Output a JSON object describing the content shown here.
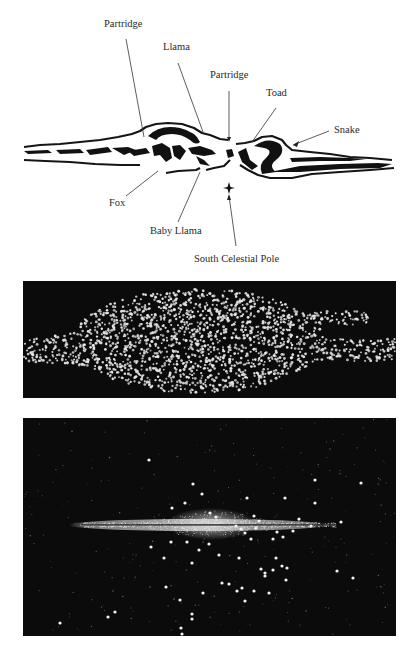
{
  "diagram": {
    "title_panel_1": "Inca dark-cloud constellations drawing",
    "labels": [
      {
        "id": "partridge-left",
        "text": "Partridge",
        "x": 104,
        "y": 25
      },
      {
        "id": "llama",
        "text": "Llama",
        "x": 163,
        "y": 48
      },
      {
        "id": "partridge-center",
        "text": "Partridge",
        "x": 210,
        "y": 76
      },
      {
        "id": "toad",
        "text": "Toad",
        "x": 265,
        "y": 94
      },
      {
        "id": "snake",
        "text": "Snake",
        "x": 333,
        "y": 123
      },
      {
        "id": "fox",
        "text": "Fox",
        "x": 109,
        "y": 196
      },
      {
        "id": "baby-llama",
        "text": "Baby Llama",
        "x": 150,
        "y": 224
      },
      {
        "id": "south-celestial-pole",
        "text": "South Celestial Pole",
        "x": 194,
        "y": 251
      }
    ],
    "leader_lines": [
      {
        "for": "partridge-left",
        "x1": 126,
        "y1": 39,
        "x2": 144,
        "y2": 137
      },
      {
        "for": "llama",
        "x1": 178,
        "y1": 63,
        "x2": 203,
        "y2": 132
      },
      {
        "for": "partridge-center",
        "x1": 229,
        "y1": 91,
        "x2": 229,
        "y2": 140
      },
      {
        "for": "toad",
        "x1": 276,
        "y1": 108,
        "x2": 252,
        "y2": 142
      },
      {
        "for": "snake",
        "x1": 329,
        "y1": 131,
        "x2": 293,
        "y2": 145
      },
      {
        "for": "fox",
        "x1": 126,
        "y1": 196,
        "x2": 158,
        "y2": 171
      },
      {
        "for": "baby-llama",
        "x1": 178,
        "y1": 222,
        "x2": 200,
        "y2": 172
      },
      {
        "for": "south-celestial-pole",
        "x1": 236,
        "y1": 246,
        "x2": 229,
        "y2": 196
      }
    ],
    "pole_marker": {
      "x": 229,
      "y": 188
    }
  },
  "panel_2": {
    "name": "Milky Way star-field drawing",
    "background": "#0b0b0b",
    "dot_color": "#e8e8e8"
  },
  "panel_3": {
    "name": "Milky Way edge-on photograph",
    "background": "#050505",
    "bright_stars": [
      [
        126,
        42
      ],
      [
        170,
        66
      ],
      [
        179,
        76
      ],
      [
        292,
        62
      ],
      [
        338,
        65
      ],
      [
        377,
        92
      ],
      [
        149,
        90
      ],
      [
        162,
        85
      ],
      [
        187,
        95
      ],
      [
        193,
        99
      ],
      [
        224,
        80
      ],
      [
        231,
        98
      ],
      [
        236,
        103
      ],
      [
        233,
        110
      ],
      [
        262,
        80
      ],
      [
        292,
        85
      ],
      [
        288,
        108
      ],
      [
        318,
        104
      ],
      [
        276,
        101
      ],
      [
        270,
        113
      ],
      [
        213,
        108
      ],
      [
        218,
        111
      ],
      [
        222,
        115
      ],
      [
        250,
        121
      ],
      [
        254,
        114
      ],
      [
        228,
        121
      ],
      [
        164,
        124
      ],
      [
        128,
        129
      ],
      [
        148,
        124
      ],
      [
        141,
        140
      ],
      [
        169,
        145
      ],
      [
        196,
        137
      ],
      [
        216,
        140
      ],
      [
        238,
        151
      ],
      [
        242,
        155
      ],
      [
        250,
        152
      ],
      [
        259,
        148
      ],
      [
        253,
        140
      ],
      [
        263,
        162
      ],
      [
        246,
        175
      ],
      [
        231,
        173
      ],
      [
        222,
        183
      ],
      [
        214,
        173
      ],
      [
        219,
        170
      ],
      [
        199,
        165
      ],
      [
        157,
        182
      ],
      [
        180,
        175
      ],
      [
        206,
        166
      ],
      [
        264,
        150
      ],
      [
        314,
        153
      ],
      [
        143,
        169
      ],
      [
        186,
        126
      ],
      [
        176,
        132
      ],
      [
        85,
        199
      ],
      [
        92,
        194
      ],
      [
        37,
        205
      ],
      [
        169,
        196
      ],
      [
        169,
        201
      ],
      [
        158,
        210
      ],
      [
        159,
        216
      ],
      [
        239,
        234
      ],
      [
        242,
        158
      ],
      [
        260,
        119
      ],
      [
        330,
        160
      ]
    ]
  }
}
